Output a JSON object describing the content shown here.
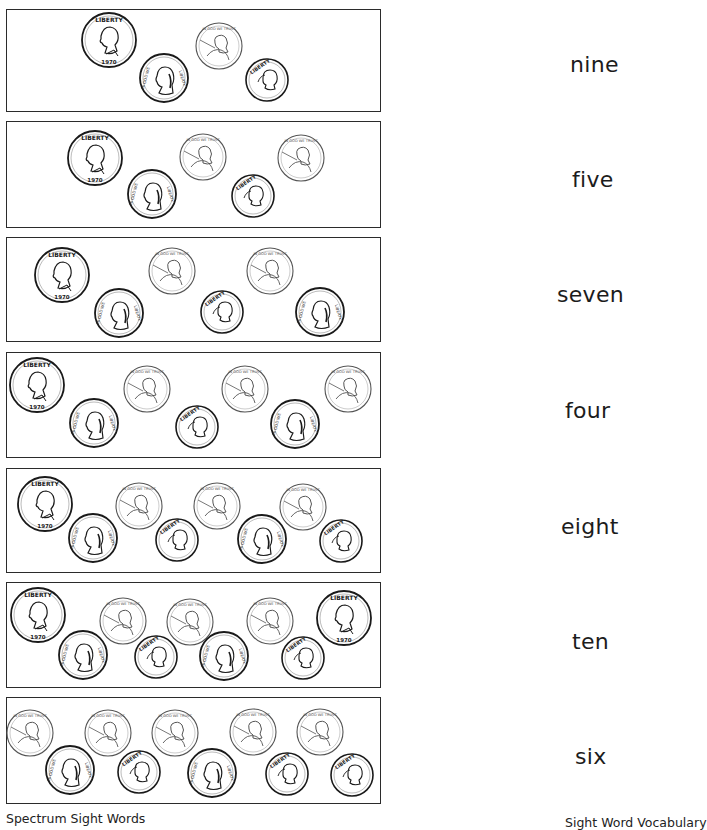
{
  "worksheet": {
    "instructions_visible": false,
    "rows": [
      {
        "word": "nine",
        "coins": [
          {
            "type": "quarter",
            "x": 109,
            "y": 40
          },
          {
            "type": "nickel",
            "x": 164,
            "y": 78
          },
          {
            "type": "penny",
            "x": 219,
            "y": 46
          },
          {
            "type": "dime",
            "x": 267,
            "y": 80
          }
        ]
      },
      {
        "word": "five",
        "coins": [
          {
            "type": "quarter",
            "x": 95,
            "y": 158
          },
          {
            "type": "nickel",
            "x": 152,
            "y": 194
          },
          {
            "type": "penny",
            "x": 203,
            "y": 157
          },
          {
            "type": "dime",
            "x": 253,
            "y": 196
          },
          {
            "type": "penny",
            "x": 301,
            "y": 158
          }
        ]
      },
      {
        "word": "seven",
        "coins": [
          {
            "type": "quarter",
            "x": 62,
            "y": 275
          },
          {
            "type": "nickel",
            "x": 119,
            "y": 313
          },
          {
            "type": "penny",
            "x": 172,
            "y": 271
          },
          {
            "type": "dime",
            "x": 222,
            "y": 312
          },
          {
            "type": "penny",
            "x": 270,
            "y": 271
          },
          {
            "type": "nickel",
            "x": 320,
            "y": 312
          }
        ]
      },
      {
        "word": "four",
        "coins": [
          {
            "type": "quarter",
            "x": 37,
            "y": 385
          },
          {
            "type": "nickel",
            "x": 94,
            "y": 423
          },
          {
            "type": "penny",
            "x": 147,
            "y": 389
          },
          {
            "type": "dime",
            "x": 197,
            "y": 427
          },
          {
            "type": "penny",
            "x": 245,
            "y": 389
          },
          {
            "type": "nickel",
            "x": 295,
            "y": 424
          },
          {
            "type": "penny",
            "x": 348,
            "y": 389
          }
        ]
      },
      {
        "word": "eight",
        "coins": [
          {
            "type": "quarter",
            "x": 45,
            "y": 504
          },
          {
            "type": "nickel",
            "x": 93,
            "y": 538
          },
          {
            "type": "penny",
            "x": 139,
            "y": 506
          },
          {
            "type": "dime",
            "x": 177,
            "y": 540
          },
          {
            "type": "penny",
            "x": 217,
            "y": 506
          },
          {
            "type": "nickel",
            "x": 262,
            "y": 539
          },
          {
            "type": "penny",
            "x": 303,
            "y": 507
          },
          {
            "type": "dime",
            "x": 341,
            "y": 541
          }
        ]
      },
      {
        "word": "ten",
        "coins": [
          {
            "type": "quarter",
            "x": 38,
            "y": 615
          },
          {
            "type": "nickel",
            "x": 83,
            "y": 655
          },
          {
            "type": "penny",
            "x": 123,
            "y": 621
          },
          {
            "type": "dime",
            "x": 156,
            "y": 657
          },
          {
            "type": "penny",
            "x": 190,
            "y": 622
          },
          {
            "type": "nickel",
            "x": 224,
            "y": 656
          },
          {
            "type": "penny",
            "x": 270,
            "y": 621
          },
          {
            "type": "dime",
            "x": 303,
            "y": 658
          },
          {
            "type": "quarter",
            "x": 344,
            "y": 618
          }
        ]
      },
      {
        "word": "six",
        "coins": [
          {
            "type": "penny",
            "x": 30,
            "y": 733
          },
          {
            "type": "nickel",
            "x": 70,
            "y": 770
          },
          {
            "type": "penny",
            "x": 108,
            "y": 733
          },
          {
            "type": "dime",
            "x": 139,
            "y": 772
          },
          {
            "type": "penny",
            "x": 175,
            "y": 733
          },
          {
            "type": "nickel",
            "x": 212,
            "y": 773
          },
          {
            "type": "penny",
            "x": 253,
            "y": 732
          },
          {
            "type": "dime",
            "x": 287,
            "y": 774
          },
          {
            "type": "penny",
            "x": 320,
            "y": 732
          },
          {
            "type": "dime",
            "x": 352,
            "y": 775
          }
        ]
      }
    ]
  },
  "coin_legend": {
    "quarter": {
      "value_cents": 25,
      "label_text": "LIBERTY",
      "year": "1970",
      "radius": 27
    },
    "nickel": {
      "value_cents": 5,
      "label_text": "IN GOD WE TRUST",
      "radius": 24
    },
    "penny": {
      "value_cents": 1,
      "label_text": "IN GOD WE TRUST",
      "radius": 23
    },
    "dime": {
      "value_cents": 10,
      "label_text": "LIBERTY",
      "radius": 21
    }
  },
  "footer": {
    "left": "Spectrum Sight Words",
    "right": "Sight Word Vocabulary"
  },
  "colors": {
    "ink": "#1a1a1a",
    "border": "#2b2b2b",
    "penny_ink": "#555555",
    "background": "#ffffff"
  }
}
